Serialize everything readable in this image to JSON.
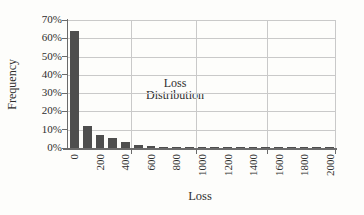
{
  "chart": {
    "ylabel": "Frequency",
    "xlabel": "Loss",
    "annotation_line1": "Loss",
    "annotation_line2": "Distribution"
  },
  "chart_data": {
    "type": "bar",
    "title": "",
    "annotation": "Loss Distribution",
    "xlabel": "Loss",
    "ylabel": "Frequency",
    "bin_width": 100,
    "categories": [
      0,
      100,
      200,
      300,
      400,
      500,
      600,
      700,
      800,
      900,
      1000,
      1100,
      1200,
      1300,
      1400,
      1500,
      1600,
      1700,
      1800,
      1900,
      2000
    ],
    "values": [
      64,
      12.3,
      7.3,
      5.2,
      3.1,
      1.7,
      1.1,
      0.8,
      0.6,
      0.4,
      0.35,
      0.3,
      0.3,
      0.3,
      0.25,
      0.25,
      0.25,
      0.25,
      0.25,
      0.25,
      0.25
    ],
    "x_tick_labels": [
      "0",
      "200",
      "400",
      "600",
      "800",
      "1000",
      "1200",
      "1400",
      "1600",
      "1800",
      "2000"
    ],
    "y_tick_labels": [
      "0%",
      "10%",
      "20%",
      "30%",
      "40%",
      "50%",
      "60%",
      "70%"
    ],
    "ylim": [
      0,
      70
    ],
    "grid": true,
    "legend": "none",
    "bar_color": "#4e4e4e",
    "gridline_color": "#c9c9c9",
    "axis_color": "#6b6b6b",
    "text_color": "#2e2e2e"
  }
}
